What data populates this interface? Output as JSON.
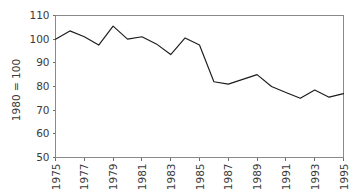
{
  "chart_data": {
    "type": "line",
    "title": "",
    "subtitle": "",
    "xlabel": "",
    "ylabel": "1980 = 100",
    "xlim": [
      1975,
      1995
    ],
    "ylim": [
      50,
      110
    ],
    "grid": false,
    "legend": null,
    "y_ticks": [
      50,
      60,
      70,
      80,
      90,
      100,
      110
    ],
    "y_tick_labels": [
      "50",
      "60",
      "70",
      "80",
      "90",
      "100",
      "110"
    ],
    "x_ticks": [
      1975,
      1977,
      1979,
      1981,
      1983,
      1985,
      1987,
      1989,
      1991,
      1993,
      1995
    ],
    "x_tick_labels": [
      "1975",
      "1977",
      "1979",
      "1981",
      "1983",
      "1985",
      "1987",
      "1989",
      "1991",
      "1993",
      "1995"
    ],
    "x": [
      1975,
      1976,
      1977,
      1978,
      1979,
      1980,
      1981,
      1982,
      1983,
      1984,
      1985,
      1986,
      1987,
      1988,
      1989,
      1990,
      1991,
      1992,
      1993,
      1994,
      1995
    ],
    "values": [
      100,
      103.5,
      101,
      97.5,
      105.5,
      100,
      101,
      98,
      93.5,
      100.5,
      97.5,
      82,
      81,
      83,
      85,
      80,
      77.5,
      75,
      78.5,
      75.5,
      77
    ],
    "series": [
      {
        "name": "index",
        "color": "#1c1c1c",
        "values": [
          100,
          103.5,
          101,
          97.5,
          105.5,
          100,
          101,
          98,
          93.5,
          100.5,
          97.5,
          82,
          81,
          83,
          85,
          80,
          77.5,
          75,
          78.5,
          75.5,
          77
        ]
      }
    ],
    "colors": {
      "line": "#1c1c1c",
      "axis": "#6b6b6b",
      "frame": "#8a8a8a",
      "text": "#3a3a3a",
      "background": "#ffffff"
    }
  }
}
